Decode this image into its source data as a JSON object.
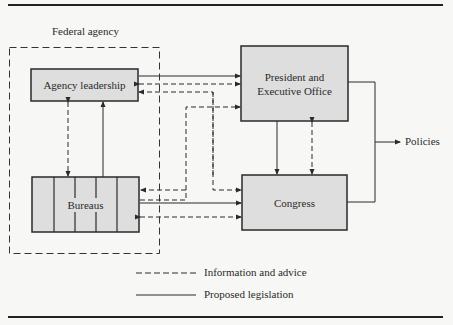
{
  "diagram": {
    "container": {
      "label": "Federal agency"
    },
    "nodes": {
      "agency_leadership": {
        "label": "Agency leadership"
      },
      "bureaus": {
        "label": "Bureaus"
      },
      "president": {
        "label_line1": "President and",
        "label_line2": "Executive Office"
      },
      "congress": {
        "label": "Congress"
      },
      "policies": {
        "label": "Policies"
      }
    },
    "legend": {
      "dashed": "Information and advice",
      "solid": "Proposed legislation"
    },
    "edges": [
      {
        "from": "Agency leadership",
        "to": "President and Executive Office",
        "type": "solid"
      },
      {
        "from": "President and Executive Office",
        "to": "Agency leadership",
        "type": "dashed",
        "bidirectional": true
      },
      {
        "from": "Congress",
        "to": "Agency leadership",
        "type": "dashed"
      },
      {
        "from": "Agency leadership",
        "to": "Bureaus",
        "type": "dashed",
        "bidirectional": true
      },
      {
        "from": "Bureaus",
        "to": "Agency leadership",
        "type": "solid"
      },
      {
        "from": "Bureaus",
        "to": "President and Executive Office",
        "type": "dashed"
      },
      {
        "from": "President and Executive Office",
        "to": "Bureaus",
        "type": "dashed"
      },
      {
        "from": "Bureaus",
        "to": "Congress",
        "type": "solid"
      },
      {
        "from": "Bureaus",
        "to": "Congress",
        "type": "dashed",
        "bidirectional": true
      },
      {
        "from": "President and Executive Office",
        "to": "Congress",
        "type": "solid"
      },
      {
        "from": "Congress",
        "to": "President and Executive Office",
        "type": "dashed",
        "bidirectional": true
      },
      {
        "from": "President and Executive Office",
        "to": "Policies",
        "type": "solid"
      },
      {
        "from": "Congress",
        "to": "Policies",
        "type": "solid"
      }
    ],
    "colors": {
      "box_fill": "#dedede",
      "stroke": "#2a2a2a",
      "background": "#f7f7f5"
    }
  }
}
